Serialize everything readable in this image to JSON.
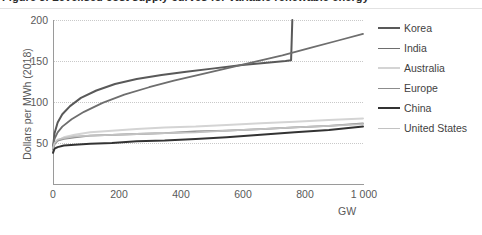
{
  "caption": {
    "text": "Figure 3. Levelised cost supply curves for variable renewable energy"
  },
  "chart_data": {
    "type": "line",
    "title": "",
    "xlabel": "GW",
    "ylabel": "Dollars per MWh (2018)",
    "xlim": [
      0,
      1000
    ],
    "ylim": [
      0,
      200
    ],
    "xticks": [
      0,
      200,
      400,
      600,
      800,
      1000
    ],
    "xtick_labels": [
      "0",
      "200",
      "400",
      "600",
      "800",
      "1 000"
    ],
    "yticks": [
      50,
      100,
      150,
      200
    ],
    "ytick_labels": [
      "50",
      "100",
      "150",
      "200"
    ],
    "grid": "horizontal-dotted",
    "legend_position": "right",
    "series": [
      {
        "name": "Korea",
        "color": "#595959",
        "width": 2.0,
        "x": [
          0,
          5,
          15,
          30,
          55,
          90,
          140,
          200,
          270,
          350,
          430,
          520,
          610,
          690,
          750,
          768,
          770,
          772
        ],
        "y": [
          44,
          62,
          75,
          85,
          95,
          105,
          114,
          122,
          128,
          133,
          137,
          141,
          145,
          148,
          150,
          151,
          175,
          200
        ]
      },
      {
        "name": "India",
        "color": "#6e6e6e",
        "width": 1.8,
        "x": [
          0,
          5,
          15,
          30,
          60,
          100,
          160,
          230,
          310,
          390,
          470,
          560,
          650,
          740,
          830,
          920,
          1000
        ],
        "y": [
          46,
          55,
          63,
          70,
          79,
          88,
          99,
          109,
          118,
          126,
          133,
          141,
          149,
          157,
          166,
          175,
          183
        ]
      },
      {
        "name": "Australia",
        "color": "#d4d4d4",
        "width": 2.0,
        "x": [
          0,
          5,
          15,
          35,
          70,
          120,
          190,
          270,
          360,
          460,
          560,
          670,
          780,
          890,
          1000
        ],
        "y": [
          40,
          48,
          53,
          57,
          60,
          63,
          65,
          67,
          69,
          70,
          72,
          74,
          76,
          78,
          80
        ]
      },
      {
        "name": "Europe",
        "color": "#8c8c8c",
        "width": 1.8,
        "x": [
          0,
          5,
          15,
          35,
          70,
          120,
          190,
          270,
          360,
          460,
          560,
          670,
          780,
          890,
          1000
        ],
        "y": [
          42,
          49,
          53,
          55,
          57,
          59,
          60,
          61,
          62,
          64,
          65,
          67,
          69,
          71,
          74
        ]
      },
      {
        "name": "China",
        "color": "#333333",
        "width": 2.0,
        "x": [
          0,
          5,
          15,
          35,
          70,
          120,
          190,
          270,
          360,
          460,
          560,
          670,
          780,
          890,
          1000
        ],
        "y": [
          38,
          43,
          45,
          47,
          48,
          49,
          50,
          52,
          53,
          55,
          57,
          60,
          63,
          66,
          70
        ]
      },
      {
        "name": "United States",
        "color": "#c2c2c2",
        "width": 1.8,
        "x": [
          0,
          5,
          15,
          35,
          70,
          120,
          190,
          270,
          360,
          460,
          560,
          670,
          780,
          890,
          1000
        ],
        "y": [
          44,
          50,
          54,
          56,
          58,
          59,
          60,
          61,
          62,
          63,
          65,
          67,
          69,
          71,
          73
        ]
      }
    ]
  }
}
